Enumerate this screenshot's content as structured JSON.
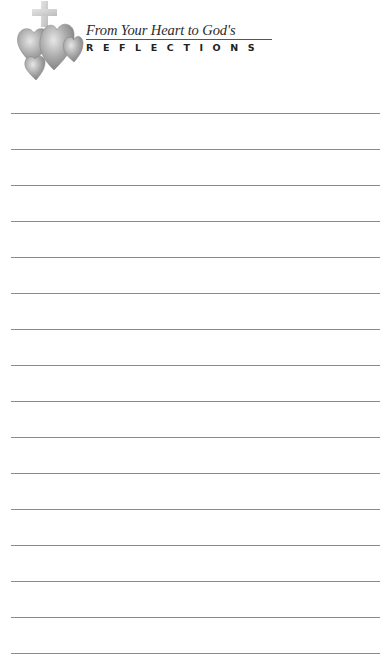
{
  "header": {
    "title_script": "From Your Heart to God's",
    "title_caps": "REFLECTIONS",
    "logo_icon": "hearts-with-cross-icon"
  },
  "journal": {
    "line_count": 16,
    "line_positions_px": [
      113,
      149,
      185,
      221,
      257,
      293,
      329,
      365,
      401,
      437,
      473,
      509,
      545,
      581,
      617,
      653
    ],
    "line_color": "#8a8a8a"
  }
}
